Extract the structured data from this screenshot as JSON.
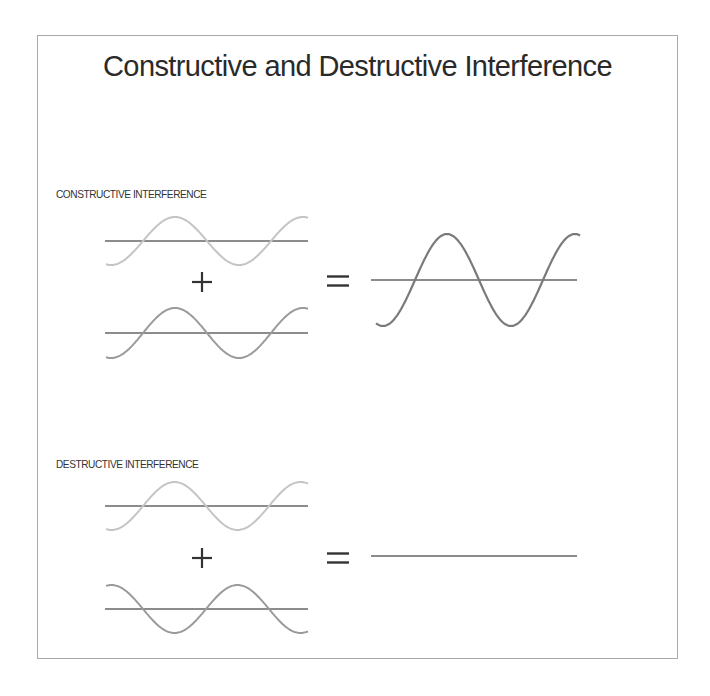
{
  "title": "Constructive and Destructive Interference",
  "colors": {
    "frame": "#a9a9a9",
    "baseline": "#666666",
    "wave_light": "#c4c4c4",
    "wave_medium": "#9a9a9a",
    "wave_result": "#7a7a7a",
    "operator": "#333333"
  },
  "sections": [
    {
      "id": "constructive",
      "label": "CONSTRUCTIVE INTERFERENCE",
      "label_y": 188,
      "wave_a": {
        "x0": 106,
        "x1": 308,
        "baseline_y": 241,
        "amplitude": 24,
        "half_period": 64,
        "first_crossing_x": 143,
        "phase": "rising",
        "color_key": "wave_light"
      },
      "plus": {
        "x": 202,
        "y": 282
      },
      "wave_b": {
        "x0": 106,
        "x1": 308,
        "baseline_y": 333,
        "amplitude": 25,
        "half_period": 64,
        "first_crossing_x": 143,
        "phase": "rising",
        "color_key": "wave_medium"
      },
      "equals": {
        "x": 327,
        "y": 281
      },
      "result": {
        "x0": 371,
        "x1": 577,
        "line_x0": 371,
        "line_x1": 577,
        "baseline_y": 280,
        "amplitude": 46,
        "half_period": 64,
        "first_crossing_x": 415,
        "wave_x0": 376,
        "wave_x1": 580,
        "phase": "rising",
        "color_key": "wave_result"
      }
    },
    {
      "id": "destructive",
      "label": "DESTRUCTIVE INTERFERENCE",
      "label_y": 458,
      "wave_a": {
        "x0": 106,
        "x1": 308,
        "baseline_y": 506,
        "amplitude": 24,
        "half_period": 63,
        "first_crossing_x": 143,
        "phase": "rising",
        "color_key": "wave_light"
      },
      "plus": {
        "x": 202,
        "y": 558
      },
      "wave_b": {
        "x0": 106,
        "x1": 308,
        "baseline_y": 609,
        "amplitude": 24,
        "half_period": 63,
        "first_crossing_x": 143,
        "phase": "falling",
        "color_key": "wave_medium"
      },
      "equals": {
        "x": 327,
        "y": 558
      },
      "result": {
        "line_x0": 371,
        "line_x1": 577,
        "baseline_y": 556,
        "amplitude": 0,
        "color_key": "baseline"
      }
    }
  ],
  "operators": {
    "plus": "+",
    "equals": "="
  }
}
